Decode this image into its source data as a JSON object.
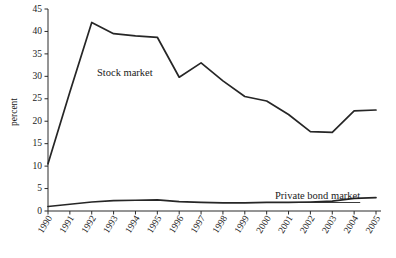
{
  "chart_data": {
    "type": "line",
    "title": "",
    "xlabel": "",
    "ylabel": "percent",
    "categories": [
      "1990",
      "1991",
      "1992",
      "1993",
      "1994",
      "1995",
      "1996",
      "1997",
      "1998",
      "1999",
      "2000",
      "2001",
      "2002",
      "2003",
      "2004",
      "2005"
    ],
    "ylim": [
      0,
      45
    ],
    "ytick_labels": [
      "0",
      "5",
      "10",
      "15",
      "20",
      "25",
      "30",
      "35",
      "40",
      "45"
    ],
    "ytick_values": [
      0,
      5,
      10,
      15,
      20,
      25,
      30,
      35,
      40,
      45
    ],
    "grid": false,
    "legend_position": "inline-annotation",
    "series": [
      {
        "name": "Stock market",
        "annotation": "Stock market",
        "values": [
          10.5,
          26.5,
          42.0,
          39.5,
          39.0,
          38.7,
          29.8,
          33.0,
          29.0,
          25.5,
          24.5,
          21.5,
          17.7,
          17.5,
          22.3,
          22.5
        ]
      },
      {
        "name": "Private bond market",
        "annotation": "Private bond market",
        "values": [
          1.0,
          1.5,
          2.0,
          2.3,
          2.4,
          2.5,
          2.1,
          1.9,
          1.8,
          1.8,
          1.9,
          1.9,
          2.0,
          2.2,
          2.8,
          3.0
        ]
      }
    ],
    "colors": {
      "line": "#262626",
      "axis": "#2a2a2a",
      "background": "#ffffff"
    }
  }
}
